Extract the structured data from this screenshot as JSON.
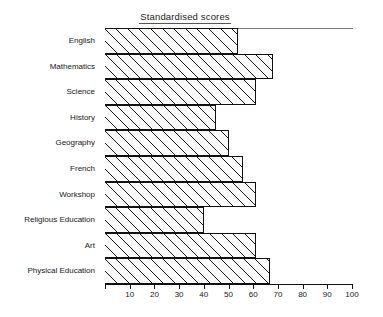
{
  "chart_data": {
    "type": "bar",
    "orientation": "horizontal",
    "title": "Standardised scores",
    "xlabel": "",
    "ylabel": "",
    "categories": [
      "English",
      "Mathematics",
      "Science",
      "History",
      "Geography",
      "French",
      "Workshop",
      "Religious Education",
      "Art",
      "Physical Education"
    ],
    "values": [
      54,
      68,
      61,
      45,
      50,
      56,
      61,
      40,
      61,
      67
    ],
    "xlim": [
      0,
      100
    ],
    "xticks": [
      0,
      10,
      20,
      30,
      40,
      50,
      60,
      70,
      80,
      90,
      100
    ],
    "xtick_labels": [
      "",
      "10",
      "20",
      "30",
      "40",
      "50",
      "60",
      "70",
      "80",
      "90",
      "100"
    ],
    "grid": false,
    "legend": false,
    "bar_fill": "hatched-diagonal",
    "bar_edge_color": "#111111",
    "background": "#ffffff"
  }
}
